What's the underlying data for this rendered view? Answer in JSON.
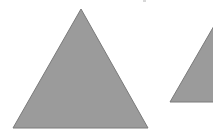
{
  "scene": {
    "background": "#ffffff",
    "shapes": [
      {
        "name": "large-triangle",
        "type": "triangle",
        "points": [
          [
            81,
            9
          ],
          [
            148,
            128
          ],
          [
            13,
            128
          ]
        ],
        "fill": "#9b9b9b",
        "stroke": "#7a7a7a"
      },
      {
        "name": "small-triangle-clipped",
        "type": "triangle",
        "points": [
          [
            222,
            12
          ],
          [
            240,
            102
          ],
          [
            170,
            102
          ]
        ],
        "fill": "#9b9b9b",
        "stroke": "#7a7a7a"
      }
    ]
  }
}
